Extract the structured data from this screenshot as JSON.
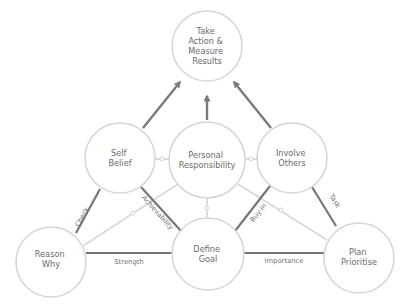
{
  "diagram": {
    "title": "",
    "nodes": {
      "take_action": {
        "lines": [
          "Take",
          "Action &",
          "Measure",
          "Results"
        ],
        "cx": 207,
        "cy": 46,
        "r": 35
      },
      "self_belief": {
        "lines": [
          "Self",
          "Belief"
        ],
        "cx": 120,
        "cy": 158,
        "r": 35
      },
      "personal_responsibility": {
        "lines": [
          "Personal",
          "Responsibility"
        ],
        "cx": 207,
        "cy": 160,
        "r": 38
      },
      "involve_others": {
        "lines": [
          "Involve",
          "Others"
        ],
        "cx": 292,
        "cy": 158,
        "r": 35
      },
      "reason_why": {
        "lines": [
          "Reason",
          "Why"
        ],
        "cx": 51,
        "cy": 262,
        "r": 35
      },
      "define_goal": {
        "lines": [
          "Define",
          "Goal"
        ],
        "cx": 208,
        "cy": 254,
        "r": 36
      },
      "plan_prioritise": {
        "lines": [
          "Plan",
          "Prioritise"
        ],
        "cx": 359,
        "cy": 258,
        "r": 35
      }
    },
    "edge_labels": {
      "check": "Check",
      "achievability": "Achievability",
      "strength": "Strength",
      "buy_in": "Buy-in",
      "task": "Task",
      "importance": "Importance"
    },
    "colors": {
      "circle_stroke": "#d6d6d6",
      "text": "#6a6a6a",
      "dark_edge": "#767676",
      "light_edge": "#d9d9d9",
      "background": "#ffffff"
    }
  }
}
